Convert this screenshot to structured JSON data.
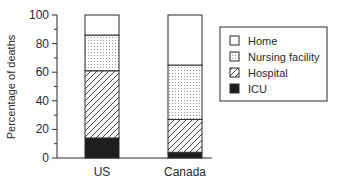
{
  "chart_data": {
    "type": "bar",
    "stacked": true,
    "title": "",
    "xlabel": "",
    "ylabel": "Percentage of deaths",
    "ylim": [
      0,
      100
    ],
    "yticks": [
      0,
      20,
      40,
      60,
      80,
      100
    ],
    "minor_tick_step": 10,
    "categories": [
      "US",
      "Canada"
    ],
    "series": [
      {
        "name": "ICU",
        "pattern": "solid-black",
        "values": [
          14,
          4
        ]
      },
      {
        "name": "Hospital",
        "pattern": "diagonal-hatch",
        "values": [
          47,
          23
        ]
      },
      {
        "name": "Nursing facility",
        "pattern": "dotted",
        "values": [
          25,
          38
        ]
      },
      {
        "name": "Home",
        "pattern": "white",
        "values": [
          14,
          35
        ]
      }
    ],
    "legend": {
      "position": "right",
      "entries": [
        "Home",
        "Nursing facility",
        "Hospital",
        "ICU"
      ]
    },
    "grid": false
  },
  "colors": {
    "ink": "#2a2a2a",
    "background": "#ffffff",
    "icu_fill": "#1e1e1e",
    "dots": "#9a9a9a"
  }
}
